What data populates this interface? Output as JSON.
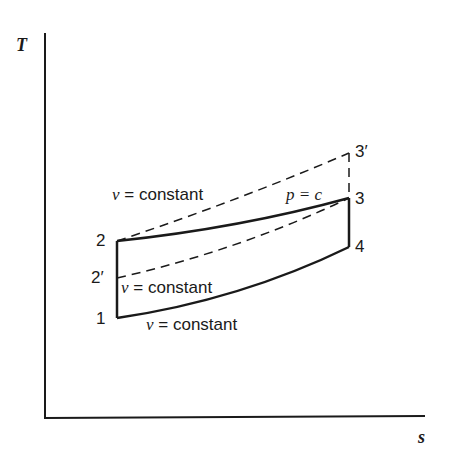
{
  "diagram": {
    "type": "T-s diagram",
    "axes": {
      "y_label": "T",
      "x_label": "s"
    },
    "states": [
      {
        "id": "1",
        "label": "1"
      },
      {
        "id": "2",
        "label": "2"
      },
      {
        "id": "2p",
        "label": "2′"
      },
      {
        "id": "3",
        "label": "3"
      },
      {
        "id": "3p",
        "label": "3′"
      },
      {
        "id": "4",
        "label": "4"
      }
    ],
    "annotations": {
      "upper_v_const": {
        "var": "v",
        "text": " = constant"
      },
      "mid_v_const": {
        "var": "v",
        "text": " = constant"
      },
      "lower_v_const": {
        "var": "v",
        "text": " = constant"
      },
      "p_const": {
        "text": "p = c"
      }
    },
    "colors": {
      "line": "#1a1a1a",
      "background": "#ffffff"
    }
  }
}
